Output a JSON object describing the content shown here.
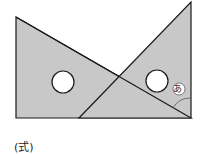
{
  "figure": {
    "angle_label": "あ",
    "colors": {
      "fill": "#c8c8c8",
      "stroke": "#1a1a1a",
      "hole": "#ffffff"
    }
  },
  "footer": {
    "formula_label": "(式)"
  }
}
